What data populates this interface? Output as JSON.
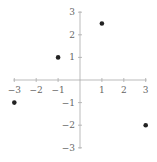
{
  "chart_data": {
    "type": "scatter",
    "title": "",
    "xlabel": "",
    "ylabel": "",
    "xlim": [
      -3,
      3
    ],
    "ylim": [
      -3,
      3
    ],
    "grid": false,
    "axes_style": "centered-at-origin",
    "x_ticks": [
      -3,
      -2,
      -1,
      1,
      2,
      3
    ],
    "y_ticks": [
      3,
      2,
      1,
      -1,
      -2,
      -3
    ],
    "x_tick_labels": [
      "−3",
      "−2",
      "−1",
      "1",
      "2",
      "3"
    ],
    "y_tick_labels": [
      "3",
      "2",
      "1",
      "−1",
      "−2",
      "−3"
    ],
    "series": [
      {
        "name": "points",
        "points": [
          {
            "x": -3,
            "y": -1
          },
          {
            "x": -1,
            "y": 1
          },
          {
            "x": 1,
            "y": 2.5
          },
          {
            "x": 3,
            "y": -2
          }
        ]
      }
    ]
  },
  "colors": {
    "axis": "#aaaaaa",
    "tick_label": "#666666",
    "point": "#222222"
  }
}
